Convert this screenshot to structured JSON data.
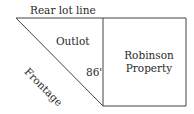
{
  "diagram": {
    "labels": {
      "rear_lot_line": "Rear lot line",
      "outlot": "Outlot",
      "frontage": "Frontage",
      "dimension": "86'",
      "property_line1": "Robinson",
      "property_line2": "Property"
    },
    "colors": {
      "line": "#444444",
      "text": "#2a2a2a",
      "background": "#ffffff"
    }
  }
}
